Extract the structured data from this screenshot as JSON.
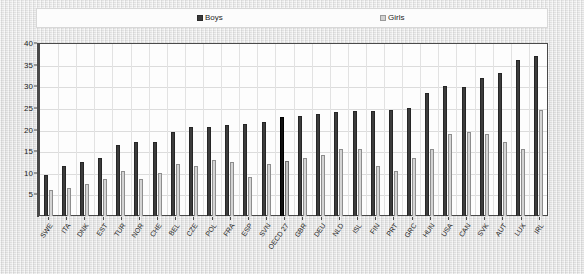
{
  "legend": {
    "boys_label": "Boys",
    "girls_label": "Girls",
    "boys_color": "#3c3c3c",
    "girls_color": "#d4d4d4"
  },
  "axis": {
    "y_ticks": [
      "40",
      "35",
      "30",
      "25",
      "20",
      "15",
      "10",
      "5"
    ]
  },
  "chart_data": {
    "type": "bar",
    "title": "",
    "subtitle": "",
    "xlabel": "",
    "ylabel": "",
    "ylim": [
      0,
      40
    ],
    "ytick_step": 5,
    "grid": true,
    "legend_position": "top",
    "highlight_category": "OECD 27",
    "categories": [
      "SWE",
      "ITA",
      "DNK",
      "EST",
      "TUR",
      "NOR",
      "CHE",
      "BEL",
      "CZE",
      "POL",
      "FRA",
      "ESP",
      "SVN",
      "OECD 27",
      "GBR",
      "DEU",
      "NLD",
      "ISL",
      "FIN",
      "PRT",
      "GRC",
      "HUN",
      "USA",
      "CAN",
      "SVK",
      "AUT",
      "LUX",
      "IRL"
    ],
    "series": [
      {
        "name": "Boys",
        "values": [
          9.5,
          11.5,
          12.5,
          13.5,
          16.5,
          17.0,
          17.2,
          19.5,
          20.5,
          20.5,
          21.0,
          21.2,
          21.8,
          22.8,
          23.2,
          23.5,
          24.0,
          24.2,
          24.3,
          24.5,
          25.0,
          28.5,
          30.0,
          29.8,
          32.0,
          33.0,
          36.0,
          37.0
        ]
      },
      {
        "name": "Girls",
        "values": [
          6.0,
          6.5,
          7.5,
          8.5,
          10.5,
          8.5,
          10.0,
          12.0,
          11.5,
          13.0,
          12.5,
          9.0,
          12.0,
          12.8,
          13.5,
          14.0,
          15.5,
          15.5,
          11.5,
          10.5,
          13.5,
          15.5,
          19.0,
          19.5,
          19.0,
          17.0,
          15.5,
          24.5
        ]
      }
    ]
  }
}
